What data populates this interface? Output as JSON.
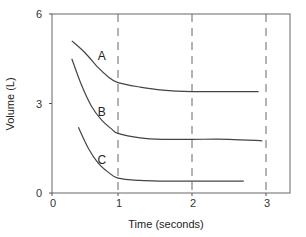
{
  "chart_data": {
    "type": "line",
    "title": "",
    "xlabel": "Time (seconds)",
    "ylabel": "Volume (L)",
    "xlim": [
      0,
      3.3
    ],
    "ylim": [
      0,
      6
    ],
    "x_ticks": [
      "0",
      "1",
      "2",
      "3"
    ],
    "y_ticks": [
      "0",
      "3",
      "6"
    ],
    "grid": false,
    "vertical_reference_lines": [
      {
        "x": 1,
        "style": "dashed"
      },
      {
        "x": 2,
        "style": "dashed"
      },
      {
        "x": 3,
        "style": "dashed"
      }
    ],
    "legend": null,
    "series": [
      {
        "name": "A",
        "x": [
          0.3,
          0.5,
          0.7,
          0.85,
          1.0,
          1.3,
          1.6,
          2.0,
          2.5,
          2.9
        ],
        "values": [
          5.1,
          4.7,
          4.2,
          3.9,
          3.7,
          3.55,
          3.45,
          3.4,
          3.4,
          3.4
        ]
      },
      {
        "name": "B",
        "x": [
          0.3,
          0.45,
          0.6,
          0.75,
          0.9,
          1.0,
          1.3,
          1.6,
          2.0,
          2.5,
          2.95
        ],
        "values": [
          4.5,
          3.6,
          2.9,
          2.45,
          2.15,
          2.0,
          1.85,
          1.8,
          1.8,
          1.8,
          1.75
        ]
      },
      {
        "name": "C",
        "x": [
          0.4,
          0.55,
          0.7,
          0.85,
          1.0,
          1.3,
          1.6,
          2.0,
          2.4,
          2.7
        ],
        "values": [
          2.2,
          1.5,
          1.0,
          0.7,
          0.5,
          0.42,
          0.4,
          0.4,
          0.4,
          0.4
        ]
      }
    ],
    "annotations": [
      {
        "text": "A",
        "x": 0.68,
        "y": 4.6
      },
      {
        "text": "B",
        "x": 0.68,
        "y": 2.7
      },
      {
        "text": "C",
        "x": 0.68,
        "y": 1.1
      }
    ],
    "colors": {
      "axis": "#555555",
      "curve": "#444444",
      "dashed": "#666666"
    }
  }
}
